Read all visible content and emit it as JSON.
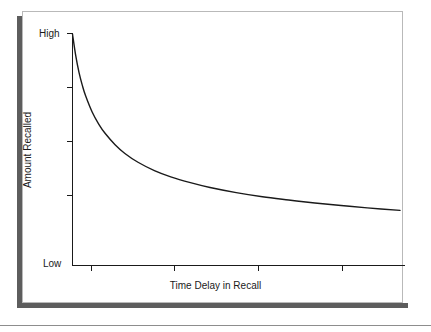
{
  "figure": {
    "frame_color": "#b9b9b9",
    "shadow_color": "#5d5d5d",
    "background": "#ffffff",
    "rule_color": "#8d8d8d"
  },
  "chart_data": {
    "type": "line",
    "title": "",
    "subtitle": "",
    "xlabel": "Time Delay in Recall",
    "ylabel": "Amount Recalled",
    "grid": false,
    "legend": null,
    "legend_position": "none",
    "line_color": "#1a1a1a",
    "axis_color": "#1a1a1a",
    "xlim": [
      0,
      1
    ],
    "ylim": [
      0,
      1
    ],
    "x_tick_labels": [
      "",
      "",
      "",
      ""
    ],
    "y_tick_labels": [
      "Low",
      "",
      "",
      "",
      "High"
    ],
    "y_axis_min_label": "Low",
    "y_axis_max_label": "High",
    "x_ticks": [
      0.057,
      0.307,
      0.559,
      0.812
    ],
    "y_ticks": [
      0.233,
      0.465,
      0.698
    ],
    "annotations": [],
    "x": [
      0.0,
      0.01,
      0.02,
      0.03,
      0.04,
      0.06,
      0.08,
      0.1,
      0.13,
      0.16,
      0.2,
      0.25,
      0.3,
      0.36,
      0.42,
      0.5,
      0.58,
      0.66,
      0.74,
      0.82,
      0.9,
      1.0
    ],
    "y": [
      1.0,
      0.905,
      0.833,
      0.778,
      0.733,
      0.663,
      0.611,
      0.57,
      0.522,
      0.484,
      0.446,
      0.41,
      0.383,
      0.358,
      0.337,
      0.315,
      0.297,
      0.283,
      0.27,
      0.259,
      0.249,
      0.238
    ],
    "series": [
      {
        "name": "Amount Recalled",
        "values": [
          1.0,
          0.905,
          0.833,
          0.778,
          0.733,
          0.663,
          0.611,
          0.57,
          0.522,
          0.484,
          0.446,
          0.41,
          0.383,
          0.358,
          0.337,
          0.315,
          0.297,
          0.283,
          0.27,
          0.259,
          0.249,
          0.238
        ]
      }
    ]
  }
}
